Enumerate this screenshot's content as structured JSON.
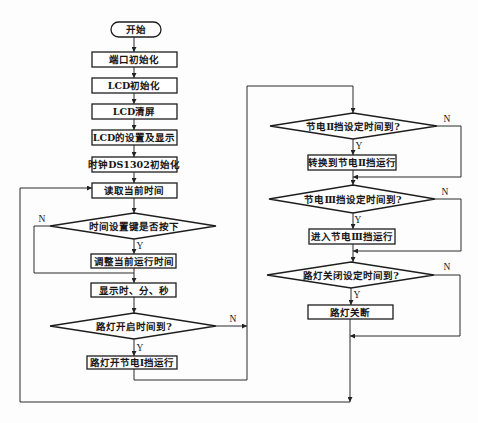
{
  "diagram": {
    "type": "flowchart",
    "branch_labels": {
      "yes": "Y",
      "no": "N"
    },
    "nodes": [
      {
        "id": "start",
        "shape": "terminal",
        "label": "开始"
      },
      {
        "id": "port_init",
        "shape": "process",
        "label": "端口初始化"
      },
      {
        "id": "lcd_init",
        "shape": "process",
        "label": "LCD初始化"
      },
      {
        "id": "lcd_clear",
        "shape": "process",
        "label": "LCD清屏"
      },
      {
        "id": "lcd_setup_display",
        "shape": "process",
        "label": "LCD的设置及显示"
      },
      {
        "id": "ds1302_init",
        "shape": "process",
        "label": "时钟DS1302初始化"
      },
      {
        "id": "read_time",
        "shape": "process",
        "label": "读取当前时间"
      },
      {
        "id": "time_key_pressed",
        "shape": "decision",
        "label": "时间设置键是否按下"
      },
      {
        "id": "adjust_time",
        "shape": "process",
        "label": "调整当前运行时间"
      },
      {
        "id": "show_hms",
        "shape": "process",
        "label": "显示时、分、秒"
      },
      {
        "id": "light_on_time",
        "shape": "decision",
        "label": "路灯开启时间到?"
      },
      {
        "id": "light_on_saving1",
        "shape": "process",
        "label": "路灯开节电Ⅰ挡运行"
      },
      {
        "id": "saving2_time",
        "shape": "decision",
        "label": "节电Ⅱ挡设定时间到?"
      },
      {
        "id": "switch_saving2",
        "shape": "process",
        "label": "转换到节电Ⅱ挡运行"
      },
      {
        "id": "saving3_time",
        "shape": "decision",
        "label": "节电Ⅲ挡设定时间到?"
      },
      {
        "id": "enter_saving3",
        "shape": "process",
        "label": "进入节电Ⅲ挡运行"
      },
      {
        "id": "light_off_time",
        "shape": "decision",
        "label": "路灯关闭设定时间到?"
      },
      {
        "id": "light_off",
        "shape": "process",
        "label": "路灯关断"
      }
    ],
    "colors": {
      "line": "#1e1e1e",
      "background": "#fdfdfd"
    }
  }
}
